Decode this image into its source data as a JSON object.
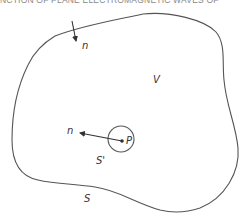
{
  "header": {
    "running_title": "NCTION OF PLANE ELECTROMAGNETIC WAVES OF"
  },
  "diagram": {
    "labels": {
      "outer_normal": "n",
      "volume": "V",
      "inner_normal": "n",
      "point": "P",
      "small_surface": "S'",
      "surface": "S"
    },
    "colors": {
      "stroke": "#555555",
      "text": "#333333",
      "background": "#ffffff"
    }
  }
}
